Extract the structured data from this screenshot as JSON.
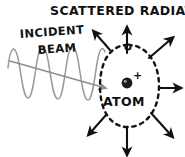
{
  "diagram": {
    "title": "SCATTERED RADIATION",
    "incident_label_line1": "INCIDENT",
    "incident_label_line2": "BEAM",
    "atom_label": "ATOM",
    "nucleus_charge": "+",
    "colors": {
      "ink": "#111111",
      "wave": "#9a9a9a",
      "beam_arrow": "#8e8e8e",
      "background": "#ffffff",
      "nucleus": "#1a1a1a",
      "electron": "#1a1a1a"
    },
    "parts": {
      "wave_name": "incident-wave",
      "beam_arrow_name": "incident-beam-arrow",
      "atom_orbit_name": "atom-orbit-dashed-oval",
      "nucleus_name": "nucleus",
      "electron_name": "electron"
    },
    "scattered_arrows": [
      {
        "id": "up",
        "direction": "up",
        "label": ""
      },
      {
        "id": "up-left",
        "direction": "up-left",
        "label": ""
      },
      {
        "id": "up-right",
        "direction": "up-right",
        "label": ""
      },
      {
        "id": "right",
        "direction": "right",
        "label": ""
      },
      {
        "id": "down-right",
        "direction": "down-right",
        "label": ""
      },
      {
        "id": "down",
        "direction": "down",
        "label": ""
      },
      {
        "id": "down-left",
        "direction": "down-left",
        "label": ""
      }
    ]
  }
}
